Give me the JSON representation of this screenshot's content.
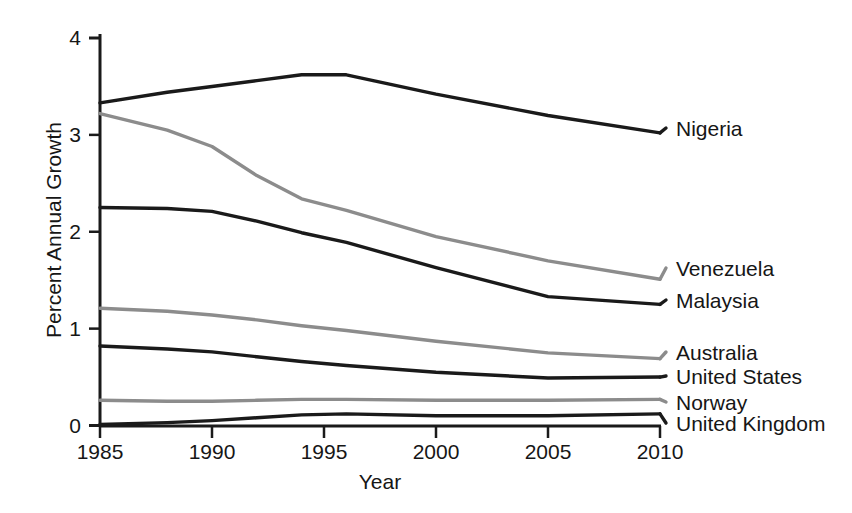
{
  "chart_data": {
    "type": "line",
    "title": "",
    "xlabel": "Year",
    "ylabel": "Percent Annual Growth",
    "xlim": [
      1985,
      2010
    ],
    "ylim": [
      0,
      4
    ],
    "grid": false,
    "legend_position": "right-inline",
    "xticks": [
      "1985",
      "1990",
      "1995",
      "2000",
      "2005",
      "2010"
    ],
    "xtick_values": [
      1985,
      1990,
      1995,
      2000,
      2005,
      2010
    ],
    "yticks": [
      "0",
      "1",
      "2",
      "3",
      "4"
    ],
    "ytick_values": [
      0,
      1,
      2,
      3,
      4
    ],
    "x": [
      1985,
      1988,
      1990,
      1992,
      1994,
      1996,
      2000,
      2005,
      2010
    ],
    "series": [
      {
        "name": "Nigeria",
        "color": "#1a1a1a",
        "values": [
          3.33,
          3.44,
          3.5,
          3.56,
          3.62,
          3.62,
          3.42,
          3.2,
          3.02
        ]
      },
      {
        "name": "Venezuela",
        "color": "#8c8c8c",
        "values": [
          3.22,
          3.05,
          2.88,
          2.58,
          2.34,
          2.22,
          1.95,
          1.7,
          1.51
        ]
      },
      {
        "name": "Malaysia",
        "color": "#1a1a1a",
        "values": [
          2.25,
          2.24,
          2.21,
          2.11,
          1.99,
          1.89,
          1.63,
          1.33,
          1.25
        ]
      },
      {
        "name": "Australia",
        "color": "#8c8c8c",
        "values": [
          1.21,
          1.18,
          1.14,
          1.09,
          1.03,
          0.98,
          0.87,
          0.75,
          0.69
        ]
      },
      {
        "name": "United States",
        "color": "#1a1a1a",
        "values": [
          0.82,
          0.79,
          0.76,
          0.71,
          0.66,
          0.62,
          0.55,
          0.49,
          0.5
        ]
      },
      {
        "name": "Norway",
        "color": "#8c8c8c",
        "values": [
          0.26,
          0.25,
          0.25,
          0.26,
          0.27,
          0.27,
          0.26,
          0.26,
          0.27
        ]
      },
      {
        "name": "United Kingdom",
        "color": "#1a1a1a",
        "values": [
          0.01,
          0.03,
          0.05,
          0.08,
          0.11,
          0.12,
          0.1,
          0.1,
          0.12
        ]
      }
    ],
    "series_label_positions_y": [
      3.02,
      1.51,
      1.25,
      0.72,
      0.5,
      0.27,
      0.08
    ]
  }
}
